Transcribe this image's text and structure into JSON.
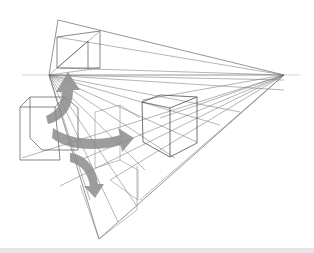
{
  "diagram": {
    "type": "three-point-perspective-sketch",
    "line_color": "#555555",
    "light_line_color": "#9a9a9a",
    "arrow_color": "#8c8c8c",
    "background": "#ffffff",
    "vanishing_points": {
      "left": [
        49,
        75
      ],
      "right": [
        284,
        75
      ],
      "top": [
        58,
        20
      ],
      "bottom": [
        99,
        239
      ]
    },
    "horizon_y": 75,
    "arrows_count": 3
  }
}
